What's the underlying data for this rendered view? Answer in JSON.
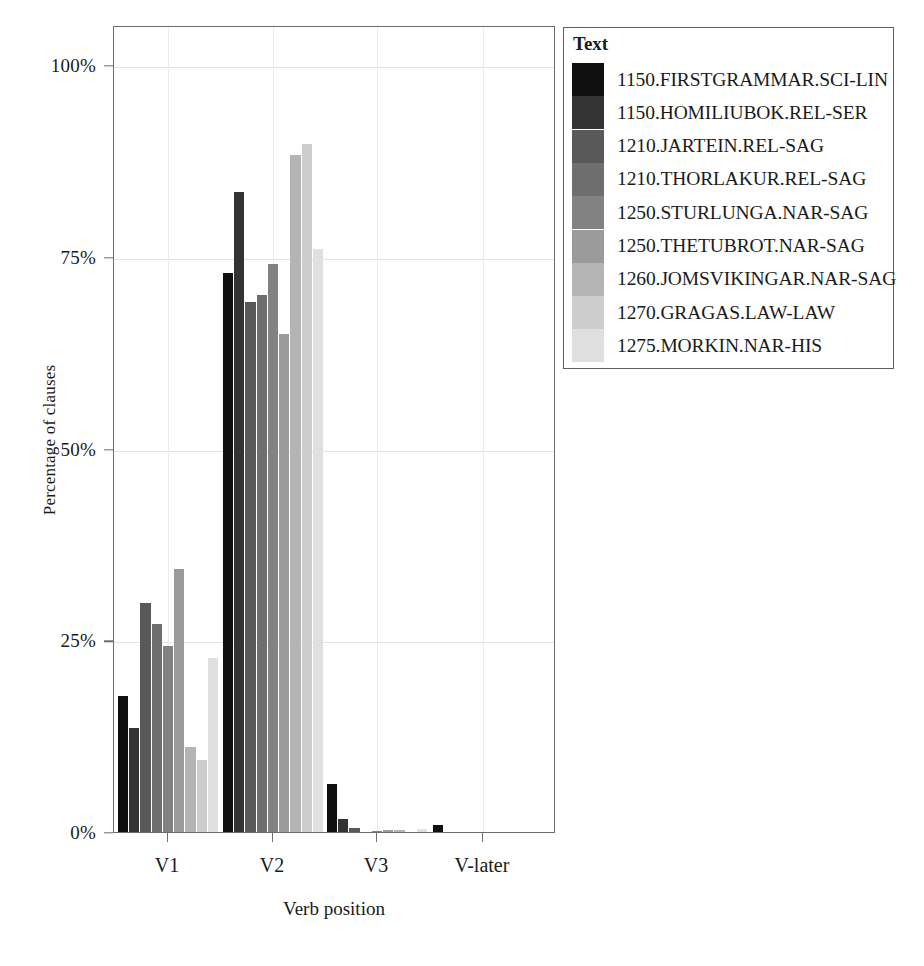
{
  "chart_data": {
    "type": "bar",
    "title": "",
    "subtitle": "",
    "xlabel": "Verb position",
    "ylabel": "Percentage of clauses",
    "categories": [
      "V1",
      "V2",
      "V3",
      "V-later"
    ],
    "ylim": [
      0,
      104
    ],
    "y_ticks": [
      0,
      25,
      50,
      75,
      100
    ],
    "y_tick_labels": [
      "0%",
      "25%",
      "50%",
      "75%",
      "100%"
    ],
    "grid": true,
    "legend_title": "Text",
    "legend_position": "right-outside",
    "series": [
      {
        "name": "1150.FIRSTGRAMMAR.SCI-LIN",
        "color": "#0f0f0f",
        "values": [
          17.9,
          73.0,
          6.4,
          1.0
        ]
      },
      {
        "name": "1150.HOMILIUBOK.REL-SER",
        "color": "#333333",
        "values": [
          13.7,
          83.6,
          1.8,
          0.0
        ]
      },
      {
        "name": "1210.JARTEIN.REL-SAG",
        "color": "#595959",
        "values": [
          30.0,
          69.2,
          0.6,
          0.0
        ]
      },
      {
        "name": "1210.THORLAKUR.REL-SAG",
        "color": "#6e6e6e",
        "values": [
          27.3,
          70.1,
          0.0,
          0.0
        ]
      },
      {
        "name": "1250.STURLUNGA.NAR-SAG",
        "color": "#828282",
        "values": [
          24.4,
          74.2,
          0.3,
          0.0
        ]
      },
      {
        "name": "1250.THETUBROT.NAR-SAG",
        "color": "#9b9b9b",
        "values": [
          34.4,
          65.0,
          0.4,
          0.0
        ]
      },
      {
        "name": "1260.JOMSVIKINGAR.NAR-SAG",
        "color": "#b4b4b4",
        "values": [
          11.2,
          88.4,
          0.4,
          0.0
        ]
      },
      {
        "name": "1270.GRAGAS.LAW-LAW",
        "color": "#cdcdcd",
        "values": [
          9.5,
          89.8,
          0.0,
          0.0
        ]
      },
      {
        "name": "1275.MORKIN.NAR-HIS",
        "color": "#e0e0e0",
        "values": [
          22.8,
          76.2,
          0.5,
          0.0
        ]
      }
    ]
  },
  "axes": {
    "x_title": "Verb position",
    "y_title": "Percentage of clauses",
    "x_tick_labels": [
      "V1",
      "V2",
      "V3",
      "V-later"
    ],
    "y_tick_labels": [
      "0%",
      "25%",
      "50%",
      "75%",
      "100%"
    ]
  },
  "legend": {
    "title": "Text",
    "items": [
      "1150.FIRSTGRAMMAR.SCI-LIN",
      "1150.HOMILIUBOK.REL-SER",
      "1210.JARTEIN.REL-SAG",
      "1210.THORLAKUR.REL-SAG",
      "1250.STURLUNGA.NAR-SAG",
      "1250.THETUBROT.NAR-SAG",
      "1260.JOMSVIKINGAR.NAR-SAG",
      "1270.GRAGAS.LAW-LAW",
      "1275.MORKIN.NAR-HIS"
    ]
  }
}
